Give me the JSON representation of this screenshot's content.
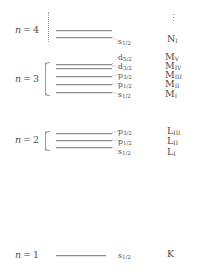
{
  "figure": {
    "ellipsis": "⋮",
    "line_color": "#8c8c8c",
    "text_color": "#4d4d4d",
    "background": "#ffffff"
  },
  "shells": [
    {
      "n_label": "n = 4",
      "n_value": 4,
      "levels": [
        {
          "orbital": "s",
          "orbital_sub": "1/2",
          "xray": "N",
          "xray_sub": "I"
        }
      ]
    },
    {
      "n_label": "n = 3",
      "n_value": 3,
      "levels": [
        {
          "orbital": "d",
          "orbital_sub": "5/2",
          "xray": "M",
          "xray_sub": "V"
        },
        {
          "orbital": "d",
          "orbital_sub": "3/2",
          "xray": "M",
          "xray_sub": "IV"
        },
        {
          "orbital": "p",
          "orbital_sub": "3/2",
          "xray": "M",
          "xray_sub": "III"
        },
        {
          "orbital": "p",
          "orbital_sub": "1/2",
          "xray": "M",
          "xray_sub": "II"
        },
        {
          "orbital": "s",
          "orbital_sub": "1/2",
          "xray": "M",
          "xray_sub": "I"
        }
      ]
    },
    {
      "n_label": "n = 2",
      "n_value": 2,
      "levels": [
        {
          "orbital": "p",
          "orbital_sub": "3/2",
          "xray": "L",
          "xray_sub": "III"
        },
        {
          "orbital": "p",
          "orbital_sub": "1/2",
          "xray": "L",
          "xray_sub": "II"
        },
        {
          "orbital": "s",
          "orbital_sub": "1/2",
          "xray": "L",
          "xray_sub": "I"
        }
      ]
    },
    {
      "n_label": "n = 1",
      "n_value": 1,
      "levels": [
        {
          "orbital": "s",
          "orbital_sub": "1/2",
          "xray": "K",
          "xray_sub": ""
        }
      ]
    }
  ],
  "chart_data": {
    "type": "diagram",
    "xlabel": "",
    "ylabel": "Energy (not to scale)",
    "grid": false,
    "legend": "none",
    "levels": [
      {
        "n": 4,
        "orbital": "s1/2",
        "xray": "NI",
        "y_px": 30,
        "line_x1": 56,
        "line_x2": 112
      },
      {
        "n": 4,
        "orbital": "",
        "xray": "",
        "y_px": 37,
        "line_x1": 56,
        "line_x2": 112
      },
      {
        "n": 3,
        "orbital": "d5/2",
        "xray": "MV",
        "y_px": 64,
        "line_x1": 56,
        "line_x2": 112
      },
      {
        "n": 3,
        "orbital": "d3/2",
        "xray": "MIV",
        "y_px": 68,
        "line_x1": 56,
        "line_x2": 112
      },
      {
        "n": 3,
        "orbital": "p3/2",
        "xray": "MIII",
        "y_px": 76,
        "line_x1": 56,
        "line_x2": 112
      },
      {
        "n": 3,
        "orbital": "p1/2",
        "xray": "MII",
        "y_px": 84,
        "line_x1": 56,
        "line_x2": 112
      },
      {
        "n": 3,
        "orbital": "s1/2",
        "xray": "MI",
        "y_px": 92,
        "line_x1": 56,
        "line_x2": 112
      },
      {
        "n": 2,
        "orbital": "p3/2",
        "xray": "LIII",
        "y_px": 133,
        "line_x1": 56,
        "line_x2": 112
      },
      {
        "n": 2,
        "orbital": "p1/2",
        "xray": "LII",
        "y_px": 140,
        "line_x1": 56,
        "line_x2": 112
      },
      {
        "n": 2,
        "orbital": "s1/2",
        "xray": "LI",
        "y_px": 147,
        "line_x1": 56,
        "line_x2": 112
      },
      {
        "n": 1,
        "orbital": "s1/2",
        "xray": "K",
        "y_px": 255,
        "line_x1": 56,
        "line_x2": 106
      }
    ],
    "annotations": [
      "⋮ above N shell indicates higher shells continue"
    ]
  }
}
